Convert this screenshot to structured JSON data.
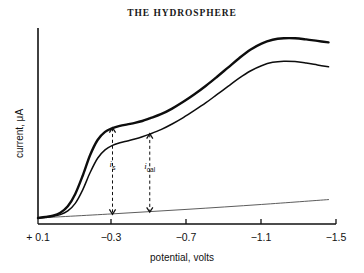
{
  "chart_data": {
    "type": "line",
    "title": "THE HYDROSPHERE",
    "xlabel": "potential, volts",
    "ylabel": "current, μA",
    "xlim": [
      0.1,
      -1.5
    ],
    "ylim": [
      0,
      10
    ],
    "grid": false,
    "legend_position": "none",
    "xticks": [
      {
        "value": 0.1,
        "label": "+ 0.1",
        "px": 38
      },
      {
        "value": -0.3,
        "label": "−0.3",
        "px": 111
      },
      {
        "value": -0.7,
        "label": "−0.7",
        "px": 186
      },
      {
        "value": -1.1,
        "label": "−1.1",
        "px": 261
      },
      {
        "value": -1.5,
        "label": "−1.5",
        "px": 336
      }
    ],
    "series": [
      {
        "name": "sample plus standard addition",
        "style": "solid-thick",
        "color": "#0d0d0d",
        "points": [
          [
            0.1,
            0.0
          ],
          [
            0.06,
            0.05
          ],
          [
            0.02,
            0.12
          ],
          [
            -0.02,
            0.28
          ],
          [
            -0.06,
            0.62
          ],
          [
            -0.1,
            1.28
          ],
          [
            -0.14,
            2.25
          ],
          [
            -0.18,
            3.35
          ],
          [
            -0.22,
            4.15
          ],
          [
            -0.26,
            4.58
          ],
          [
            -0.3,
            4.78
          ],
          [
            -0.34,
            4.9
          ],
          [
            -0.38,
            4.98
          ],
          [
            -0.42,
            5.06
          ],
          [
            -0.46,
            5.16
          ],
          [
            -0.5,
            5.3
          ],
          [
            -0.56,
            5.52
          ],
          [
            -0.62,
            5.82
          ],
          [
            -0.68,
            6.18
          ],
          [
            -0.74,
            6.58
          ],
          [
            -0.8,
            7.02
          ],
          [
            -0.86,
            7.5
          ],
          [
            -0.92,
            8.0
          ],
          [
            -0.98,
            8.5
          ],
          [
            -1.04,
            8.95
          ],
          [
            -1.1,
            9.28
          ],
          [
            -1.16,
            9.48
          ],
          [
            -1.22,
            9.56
          ],
          [
            -1.28,
            9.56
          ],
          [
            -1.34,
            9.5
          ],
          [
            -1.4,
            9.42
          ],
          [
            -1.46,
            9.34
          ]
        ]
      },
      {
        "name": "sample alone",
        "style": "solid-thin",
        "color": "#0d0d0d",
        "points": [
          [
            0.1,
            0.0
          ],
          [
            0.06,
            0.04
          ],
          [
            0.02,
            0.09
          ],
          [
            -0.02,
            0.18
          ],
          [
            -0.06,
            0.38
          ],
          [
            -0.1,
            0.78
          ],
          [
            -0.14,
            1.5
          ],
          [
            -0.18,
            2.42
          ],
          [
            -0.22,
            3.18
          ],
          [
            -0.26,
            3.62
          ],
          [
            -0.3,
            3.86
          ],
          [
            -0.34,
            4.0
          ],
          [
            -0.38,
            4.1
          ],
          [
            -0.42,
            4.2
          ],
          [
            -0.46,
            4.32
          ],
          [
            -0.5,
            4.46
          ],
          [
            -0.56,
            4.7
          ],
          [
            -0.62,
            5.0
          ],
          [
            -0.68,
            5.34
          ],
          [
            -0.74,
            5.72
          ],
          [
            -0.8,
            6.12
          ],
          [
            -0.86,
            6.56
          ],
          [
            -0.92,
            7.0
          ],
          [
            -0.98,
            7.44
          ],
          [
            -1.04,
            7.82
          ],
          [
            -1.1,
            8.1
          ],
          [
            -1.16,
            8.28
          ],
          [
            -1.22,
            8.34
          ],
          [
            -1.28,
            8.32
          ],
          [
            -1.34,
            8.24
          ],
          [
            -1.4,
            8.14
          ],
          [
            -1.46,
            8.04
          ]
        ]
      },
      {
        "name": "residual current baseline",
        "style": "solid-hairline",
        "color": "#4a4a4a",
        "points": [
          [
            0.1,
            0.0
          ],
          [
            -0.3,
            0.22
          ],
          [
            -0.7,
            0.46
          ],
          [
            -1.1,
            0.72
          ],
          [
            -1.46,
            0.98
          ]
        ]
      }
    ],
    "annotations": [
      {
        "id": "i-s",
        "label_html": "<i>i</i><sub>s</sub>",
        "label_text": "i_s",
        "x": -0.3,
        "y_top": 4.78,
        "y_bottom": 0.22,
        "style": "dashed-double-arrow"
      },
      {
        "id": "i-cal",
        "label_html": "<i>i</i><sub>cal</sub>",
        "label_text": "i_cal",
        "x": -0.5,
        "y_top": 4.46,
        "y_bottom": 0.33,
        "style": "dashed-double-arrow"
      }
    ]
  },
  "labels": {
    "title": "THE HYDROSPHERE",
    "xlabel": "potential, volts",
    "ylabel": "current, μA"
  }
}
